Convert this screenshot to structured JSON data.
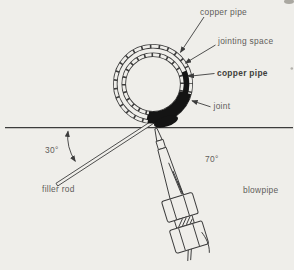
{
  "diagram": {
    "labels": {
      "copper_pipe_outer": "copper pipe",
      "jointing_space": "jointing space",
      "copper_pipe_inner": "copper pipe",
      "joint": "joint",
      "filler_rod_angle": "30°",
      "blowpipe_angle": "70°",
      "filler_rod": "filler rod",
      "blowpipe": "blowpipe"
    },
    "colors": {
      "background": "#efeeea",
      "line": "#3c3c3c",
      "label_text": "#5f5d5a",
      "joint_black": "#141414"
    }
  }
}
